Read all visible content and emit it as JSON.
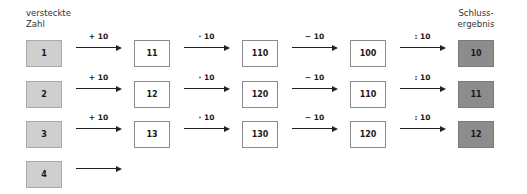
{
  "headers": {
    "left_line1": "versteckte",
    "left_line2": "Zahl",
    "right_line1": "Schluss-",
    "right_line2": "ergebnis"
  },
  "operations": [
    "+ 10",
    "· 10",
    "− 10",
    ": 10"
  ],
  "rows": [
    {
      "start": "1",
      "values": [
        "11",
        "110",
        "100"
      ],
      "result": "10"
    },
    {
      "start": "2",
      "values": [
        "12",
        "120",
        "110"
      ],
      "result": "11"
    },
    {
      "start": "3",
      "values": [
        "13",
        "130",
        "120"
      ],
      "result": "12"
    },
    {
      "start": "4",
      "values": [],
      "result": ""
    }
  ],
  "colors": {
    "start_box": "#cfcfcf",
    "middle_box": "#ffffff",
    "result_box": "#8c8c8c",
    "arrow": "#222222"
  }
}
